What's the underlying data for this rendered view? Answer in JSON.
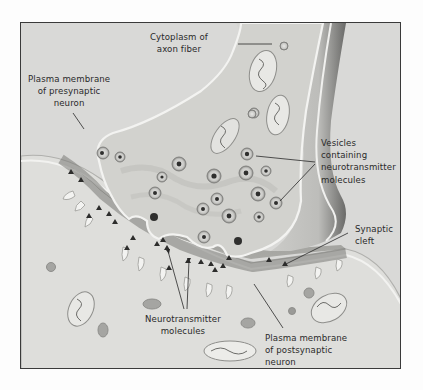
{
  "figure": {
    "colors": {
      "background": "#d9d9d7",
      "postsynaptic_cytoplasm": "#dcdcd9",
      "presynaptic_terminal": "#cfcfcb",
      "synaptic_cleft": "#8f8f8b",
      "axon_shadow": "#5e5e5c",
      "frame_border": "#3a3a3a",
      "label_text": "#2a2a2a"
    },
    "labels": {
      "cytoplasm": {
        "line1": "Cytoplasm of",
        "line2": "axon fiber"
      },
      "pre_membrane": {
        "line1": "Plasma membrane",
        "line2": "of presynaptic",
        "line3": "neuron"
      },
      "vesicles": {
        "line1": "Vesicles",
        "line2": "containing",
        "line3": "neurotransmitter",
        "line4": "molecules"
      },
      "cleft": {
        "line1": "Synaptic",
        "line2": "cleft"
      },
      "neurotransmitter": {
        "line1": "Neurotransmitter",
        "line2": "molecules"
      },
      "post_membrane": {
        "line1": "Plasma membrane",
        "line2": "of postsynaptic",
        "line3": "neuron"
      }
    }
  }
}
